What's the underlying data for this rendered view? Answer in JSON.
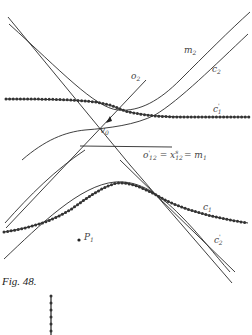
{
  "figure": {
    "caption": "Fig. 48.",
    "labels": {
      "m2": "m",
      "m2_sub": "2",
      "c2": "c",
      "c2_sub": "2",
      "o2": "o",
      "o2_sub": "2",
      "c1prime": "c",
      "c1prime_sub": "1",
      "c1prime_sup": "'",
      "v0": "v",
      "v0_sub": "0",
      "o12": "o",
      "o12_sub": "12",
      "o12_sup": "'",
      "eq1": "= x",
      "x_sub": "12",
      "x_sup": "s",
      "eq2": "= m",
      "m1_sub": "1",
      "c1": "c",
      "c1_sub": "1",
      "p1": "P",
      "p1_sub": "1",
      "c2prime": "c",
      "c2prime_sub": "2",
      "c2prime_sup": "'"
    }
  }
}
